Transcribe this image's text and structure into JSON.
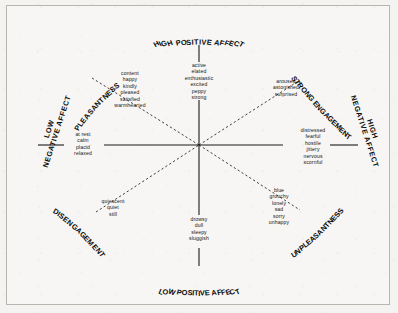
{
  "figure": {
    "background_color": "#f7f6f4",
    "ink_color": "#111111"
  },
  "poles": {
    "top": "HIGH POSITIVE AFFECT",
    "bottom": "LOW POSITIVE AFFECT",
    "left_line1": "LOW",
    "left_line2": "NEGATIVE AFFECT",
    "right_line1": "HIGH",
    "right_line2": "NEGATIVE AFFECT",
    "upper_left": "PLEASANTNESS",
    "upper_right": "STRONG ENGAGEMENT",
    "lower_left": "DISENGAGEMENT",
    "lower_right": "UNPLEASANTNESS"
  },
  "word_groups": {
    "high_positive_affect": [
      "active",
      "elated",
      "enthusiastic",
      "excited",
      "peppy",
      "strong"
    ],
    "pleasantness": [
      "content",
      "happy",
      "kindly",
      "pleased",
      "satisfied",
      "warmhearted"
    ],
    "strong_engagement": [
      "aroused",
      "astonished",
      "surprised"
    ],
    "high_negative_affect": [
      "distressed",
      "fearful",
      "hostile",
      "jittery",
      "nervous",
      "scornful"
    ],
    "unpleasantness": [
      "blue",
      "grouchy",
      "lonely",
      "sad",
      "sorry",
      "unhappy"
    ],
    "low_positive_affect": [
      "drowsy",
      "dull",
      "sleepy",
      "sluggish"
    ],
    "disengagement": [
      "quiescent",
      "quiet",
      "still"
    ],
    "low_negative_affect": [
      "at rest",
      "calm",
      "placid",
      "relaxed"
    ]
  }
}
